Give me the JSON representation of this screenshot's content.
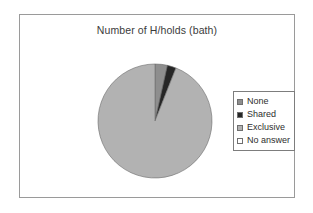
{
  "chart_data": {
    "type": "pie",
    "title": "Number of H/holds (bath)",
    "categories": [
      "None",
      "Shared",
      "Exclusive",
      "No answer"
    ],
    "values": [
      3.5,
      2.5,
      94,
      0
    ],
    "unit": "percent",
    "colors": [
      "#8e8e8e",
      "#262626",
      "#b2b2b2",
      "#ffffff"
    ],
    "legend_position": "right",
    "grid": false,
    "start_angle": 0,
    "xlabel": "",
    "ylabel": ""
  },
  "chart": {
    "title": "Number of H/holds (bath)",
    "legend": {
      "items": [
        {
          "label": "None",
          "color": "#8e8e8e"
        },
        {
          "label": "Shared",
          "color": "#262626"
        },
        {
          "label": "Exclusive",
          "color": "#b2b2b2"
        },
        {
          "label": "No answer",
          "color": "#ffffff"
        }
      ]
    }
  }
}
